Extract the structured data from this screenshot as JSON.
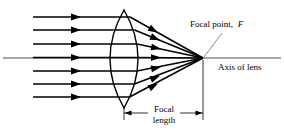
{
  "diagram": {
    "labels": {
      "focal_point": "Focal point,",
      "focal_point_symbol": "F",
      "axis_of_lens": "Axis of lens",
      "focal_length_line1": "Focal",
      "focal_length_line2": "length"
    },
    "colors": {
      "ray": "#000000",
      "lens_outline": "#000000",
      "axis": "#000000",
      "dimension": "#000000",
      "leader": "#555555",
      "background": "#ffffff"
    },
    "geometry": {
      "lens_center_x": 124,
      "lens_top_y": 10,
      "lens_bottom_y": 108,
      "lens_bulge": 14,
      "axis_y": 58,
      "focal_point_x": 203,
      "focal_point_y": 58,
      "ray_start_x": 33,
      "axis_left_x": 3,
      "axis_right_x": 281,
      "dimension_y": 113,
      "ray_count": 7,
      "ray_y_positions": [
        17,
        30,
        44,
        57,
        71,
        84,
        97
      ]
    }
  }
}
